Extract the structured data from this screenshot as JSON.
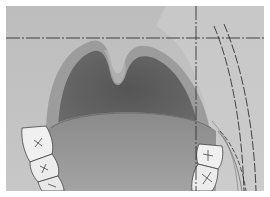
{
  "figure": {
    "parts": [
      "palate",
      "uvula",
      "pharynx",
      "tongue",
      "upper molars left",
      "upper molars right"
    ],
    "reference_lines": {
      "horizontal_dashed": {
        "y": 32
      },
      "vertical_dashed": {
        "x": 190
      },
      "curved_dashed_count": 3
    },
    "colors": {
      "background": "#c9c9c9",
      "pharynx": "#5a5a5a",
      "tongue": "#8f8f8f",
      "tooth": "#efefef",
      "line": "#333333"
    }
  }
}
